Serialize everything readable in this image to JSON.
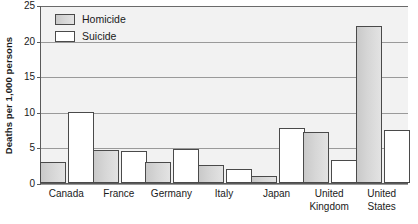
{
  "chart_data": {
    "type": "bar",
    "title": "",
    "subtitle": "",
    "xlabel": "",
    "ylabel": "Deaths per 1,000 persons",
    "categories": [
      "Canada",
      "France",
      "Germany",
      "Italy",
      "Japan",
      "United Kingdom",
      "United States"
    ],
    "series": [
      {
        "name": "Homicide",
        "color": "#d6d6d6",
        "values": [
          3.0,
          4.6,
          3.0,
          2.6,
          1.0,
          7.1,
          22.0
        ]
      },
      {
        "name": "Suicide",
        "color": "#ffffff",
        "values": [
          10.0,
          4.5,
          4.8,
          2.0,
          7.7,
          3.2,
          7.5
        ]
      }
    ],
    "ylim": [
      0,
      25
    ],
    "yticks": [
      0,
      5,
      10,
      15,
      20,
      25
    ],
    "ytick_labels": [
      "0",
      "5",
      "10",
      "15",
      "20",
      "25"
    ],
    "grid": true,
    "grid_axis": "y",
    "legend_position": "top-left-inside",
    "plot_background": "#f2f2f2",
    "axis_color": "#5a5a5a",
    "gridline_color": "#9a9a9a"
  },
  "legend": {
    "entries": [
      {
        "label": "Homicide",
        "swatch": "homicide"
      },
      {
        "label": "Suicide",
        "swatch": "suicide"
      }
    ]
  },
  "x_labels": [
    {
      "line1": "Canada",
      "line2": ""
    },
    {
      "line1": "France",
      "line2": ""
    },
    {
      "line1": "Germany",
      "line2": ""
    },
    {
      "line1": "Italy",
      "line2": ""
    },
    {
      "line1": "Japan",
      "line2": ""
    },
    {
      "line1": "United",
      "line2": "Kingdom"
    },
    {
      "line1": "United",
      "line2": "States"
    }
  ]
}
